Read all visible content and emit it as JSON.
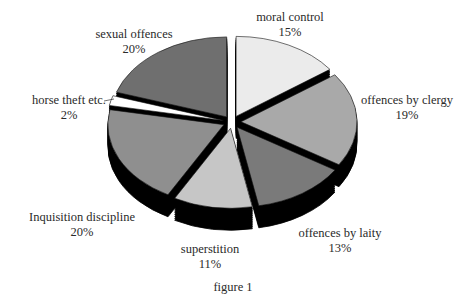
{
  "chart_data": {
    "type": "pie",
    "style": "3d-exploded",
    "title": "",
    "caption": "figure 1",
    "categories": [
      "moral control",
      "offences by clergy",
      "offences by laity",
      "superstition",
      "Inquisition discipline",
      "horse theft etc.",
      "sexual offences"
    ],
    "values": [
      15,
      19,
      13,
      11,
      20,
      2,
      20
    ],
    "value_labels": [
      "15%",
      "19%",
      "13%",
      "11%",
      "20%",
      "2%",
      "20%"
    ],
    "colors": [
      "#ebebeb",
      "#a9a9a9",
      "#7a7a7a",
      "#c6c6c6",
      "#8f8f8f",
      "#ffffff",
      "#6f6f6f"
    ],
    "side_color": "#000000",
    "start_angle": "12 o'clock",
    "direction": "clockwise",
    "legend": "none (direct labels)"
  },
  "labels": [
    {
      "name": "moral control",
      "pct": "15%"
    },
    {
      "name": "offences by clergy",
      "pct": "19%"
    },
    {
      "name": "offences by laity",
      "pct": "13%"
    },
    {
      "name": "superstition",
      "pct": "11%"
    },
    {
      "name": "Inquisition discipline",
      "pct": "20%"
    },
    {
      "name": "horse theft etc.",
      "pct": "2%"
    },
    {
      "name": "sexual offences",
      "pct": "20%"
    }
  ],
  "caption": "figure 1"
}
